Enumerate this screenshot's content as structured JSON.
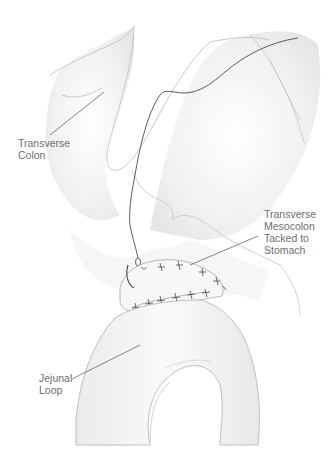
{
  "figure": {
    "type": "surgical-illustration",
    "labels": [
      {
        "id": "transverse-colon",
        "lines": [
          "Transverse",
          "Colon"
        ]
      },
      {
        "id": "transverse-mesocolon",
        "lines": [
          "Transverse",
          "Mesocolon",
          "Tacked to",
          "Stomach"
        ]
      },
      {
        "id": "jejunal-loop",
        "lines": [
          "Jejunal",
          "Loop"
        ]
      }
    ]
  },
  "colors": {
    "outline": "#b8b8b8",
    "shading": "#ececec",
    "suture": "#555555",
    "leader": "#666666",
    "label_text": "#6e6e6e"
  }
}
